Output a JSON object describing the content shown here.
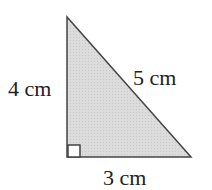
{
  "diagram": {
    "shape": "right-triangle",
    "fill_color": "#d9d9d9",
    "stroke_color": "#444444",
    "labels": {
      "left_side": "4 cm",
      "hypotenuse": "5 cm",
      "bottom_side": "3 cm"
    },
    "right_angle_marker": true
  }
}
